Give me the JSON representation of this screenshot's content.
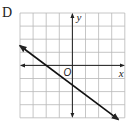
{
  "option_label": "D",
  "chart_data": {
    "type": "line",
    "title": "",
    "xlabel": "x",
    "ylabel": "y",
    "origin_label": "O",
    "xlim": [
      -4,
      4
    ],
    "ylim": [
      -4,
      4
    ],
    "grid": true,
    "grid_step": 1,
    "series": [
      {
        "name": "line",
        "equation": "y = -3/4 x - 3/2",
        "slope": -0.75,
        "y_intercept": -1.5,
        "x_intercept": -2,
        "x": [
          -4,
          3.5
        ],
        "y": [
          1.5,
          -4.125
        ],
        "arrows": "both"
      }
    ]
  }
}
